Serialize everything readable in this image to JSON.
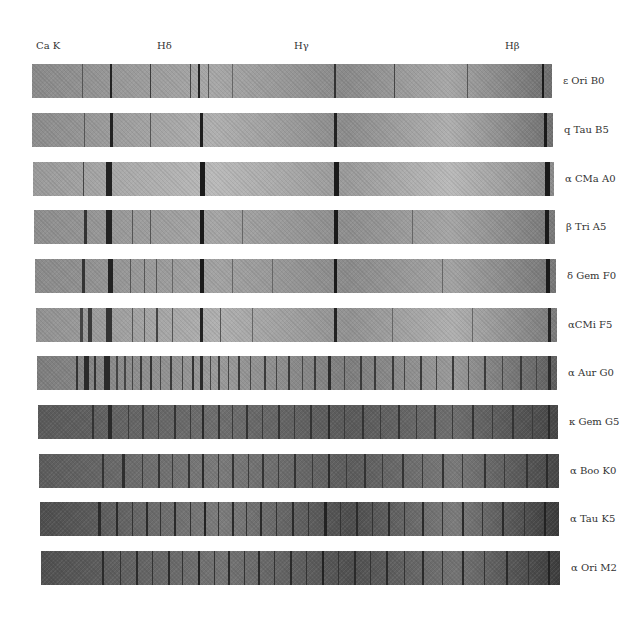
{
  "figure": {
    "line_labels": [
      {
        "text": "Ca K",
        "x": 36
      },
      {
        "text": "Hδ",
        "x": 157
      },
      {
        "text": "Hγ",
        "x": 294
      },
      {
        "text": "Hβ",
        "x": 505
      }
    ],
    "spectra": [
      {
        "label": "ε Ori B0",
        "top": 64,
        "left": 32,
        "right": 552,
        "base": "#8a8a8a",
        "light": "#a8a8a8",
        "dark_end": "#6e6e6e",
        "lines": [
          [
            50,
            1,
            "#555"
          ],
          [
            78,
            2,
            "#222"
          ],
          [
            118,
            1,
            "#3a3a3a"
          ],
          [
            158,
            1,
            "#444"
          ],
          [
            166,
            2,
            "#222"
          ],
          [
            176,
            1,
            "#555"
          ],
          [
            200,
            1,
            "#666"
          ],
          [
            302,
            2,
            "#333"
          ],
          [
            362,
            1,
            "#444"
          ],
          [
            435,
            1,
            "#555"
          ],
          [
            510,
            2,
            "#1a1a1a"
          ],
          [
            530,
            1,
            "#444"
          ]
        ]
      },
      {
        "label": "q Tau B5",
        "top": 113,
        "left": 32,
        "right": 553,
        "base": "#8c8c8c",
        "light": "#b0b0b0",
        "dark_end": "#707070",
        "lines": [
          [
            52,
            1,
            "#555"
          ],
          [
            78,
            3,
            "#222"
          ],
          [
            118,
            1,
            "#555"
          ],
          [
            168,
            3,
            "#1e1e1e"
          ],
          [
            302,
            3,
            "#222"
          ],
          [
            512,
            3,
            "#1a1a1a"
          ],
          [
            535,
            1,
            "#444"
          ]
        ]
      },
      {
        "label": "α CMa A0",
        "top": 162,
        "left": 33,
        "right": 554,
        "base": "#9a9a9a",
        "light": "#bababa",
        "dark_end": "#8a8a8a",
        "lines": [
          [
            51,
            1,
            "#444"
          ],
          [
            74,
            6,
            "#222"
          ],
          [
            168,
            5,
            "#1a1a1a"
          ],
          [
            302,
            5,
            "#1a1a1a"
          ],
          [
            513,
            5,
            "#1a1a1a"
          ]
        ]
      },
      {
        "label": "β Tri A5",
        "top": 210,
        "left": 34,
        "right": 555,
        "base": "#8e8e8e",
        "light": "#a6a6a6",
        "dark_end": "#787878",
        "lines": [
          [
            52,
            3,
            "#333"
          ],
          [
            74,
            6,
            "#222"
          ],
          [
            100,
            1,
            "#555"
          ],
          [
            118,
            1,
            "#555"
          ],
          [
            168,
            4,
            "#1a1a1a"
          ],
          [
            210,
            1,
            "#666"
          ],
          [
            302,
            4,
            "#1a1a1a"
          ],
          [
            380,
            1,
            "#666"
          ],
          [
            513,
            4,
            "#1a1a1a"
          ],
          [
            535,
            1,
            "#555"
          ]
        ]
      },
      {
        "label": "δ Gem F0",
        "top": 259,
        "left": 35,
        "right": 556,
        "base": "#8b8b8b",
        "light": "#a3a3a3",
        "dark_end": "#767676",
        "lines": [
          [
            50,
            3,
            "#333"
          ],
          [
            76,
            5,
            "#222"
          ],
          [
            98,
            1,
            "#555"
          ],
          [
            112,
            1,
            "#555"
          ],
          [
            124,
            1,
            "#555"
          ],
          [
            140,
            1,
            "#666"
          ],
          [
            168,
            4,
            "#1a1a1a"
          ],
          [
            200,
            1,
            "#666"
          ],
          [
            240,
            1,
            "#666"
          ],
          [
            302,
            3,
            "#1a1a1a"
          ],
          [
            410,
            1,
            "#666"
          ],
          [
            514,
            4,
            "#1a1a1a"
          ],
          [
            535,
            1,
            "#444"
          ],
          [
            545,
            1,
            "#555"
          ]
        ]
      },
      {
        "label": "αCMi F5",
        "top": 308,
        "left": 36,
        "right": 557,
        "base": "#929292",
        "light": "#b0b0b0",
        "dark_end": "#7a7a7a",
        "lines": [
          [
            48,
            3,
            "#444"
          ],
          [
            56,
            4,
            "#3a3a3a"
          ],
          [
            74,
            6,
            "#333"
          ],
          [
            100,
            1,
            "#555"
          ],
          [
            112,
            1,
            "#555"
          ],
          [
            124,
            2,
            "#444"
          ],
          [
            140,
            1,
            "#555"
          ],
          [
            168,
            3,
            "#222"
          ],
          [
            188,
            1,
            "#555"
          ],
          [
            220,
            1,
            "#666"
          ],
          [
            302,
            3,
            "#222"
          ],
          [
            360,
            1,
            "#666"
          ],
          [
            440,
            1,
            "#666"
          ],
          [
            516,
            3,
            "#222"
          ]
        ]
      },
      {
        "label": "α Aur G0",
        "top": 356,
        "left": 37,
        "right": 557,
        "base": "#7e7e7e",
        "light": "#9a9a9a",
        "dark_end": "#5e5e5e",
        "lines": [
          [
            44,
            2,
            "#333"
          ],
          [
            52,
            5,
            "#2a2a2a"
          ],
          [
            62,
            2,
            "#333"
          ],
          [
            72,
            6,
            "#2a2a2a"
          ],
          [
            84,
            2,
            "#444"
          ],
          [
            92,
            2,
            "#444"
          ],
          [
            100,
            1,
            "#444"
          ],
          [
            108,
            2,
            "#3a3a3a"
          ],
          [
            118,
            2,
            "#333"
          ],
          [
            128,
            1,
            "#444"
          ],
          [
            138,
            2,
            "#3a3a3a"
          ],
          [
            150,
            1,
            "#444"
          ],
          [
            160,
            2,
            "#333"
          ],
          [
            168,
            3,
            "#2a2a2a"
          ],
          [
            178,
            1,
            "#444"
          ],
          [
            186,
            2,
            "#3a3a3a"
          ],
          [
            196,
            1,
            "#444"
          ],
          [
            206,
            2,
            "#3a3a3a"
          ],
          [
            218,
            1,
            "#444"
          ],
          [
            232,
            2,
            "#3a3a3a"
          ],
          [
            244,
            1,
            "#444"
          ],
          [
            256,
            2,
            "#3a3a3a"
          ],
          [
            270,
            1,
            "#444"
          ],
          [
            282,
            2,
            "#3a3a3a"
          ],
          [
            296,
            3,
            "#2a2a2a"
          ],
          [
            312,
            1,
            "#444"
          ],
          [
            328,
            2,
            "#3a3a3a"
          ],
          [
            342,
            2,
            "#3a3a3a"
          ],
          [
            360,
            2,
            "#3a3a3a"
          ],
          [
            372,
            1,
            "#444"
          ],
          [
            388,
            2,
            "#3a3a3a"
          ],
          [
            404,
            1,
            "#444"
          ],
          [
            420,
            2,
            "#3a3a3a"
          ],
          [
            436,
            1,
            "#444"
          ],
          [
            452,
            2,
            "#3a3a3a"
          ],
          [
            470,
            1,
            "#444"
          ],
          [
            488,
            2,
            "#3a3a3a"
          ],
          [
            504,
            1,
            "#444"
          ],
          [
            516,
            3,
            "#2a2a2a"
          ],
          [
            532,
            1,
            "#444"
          ]
        ]
      },
      {
        "label": "κ Gem G5",
        "top": 405,
        "left": 38,
        "right": 558,
        "base": "#5a5a5a",
        "light": "#6e6e6e",
        "dark_end": "#464646",
        "lines": [
          [
            60,
            2,
            "#333"
          ],
          [
            76,
            4,
            "#2a2a2a"
          ],
          [
            96,
            1,
            "#3a3a3a"
          ],
          [
            110,
            2,
            "#333"
          ],
          [
            126,
            1,
            "#3a3a3a"
          ],
          [
            142,
            2,
            "#333"
          ],
          [
            158,
            1,
            "#3a3a3a"
          ],
          [
            170,
            2,
            "#2a2a2a"
          ],
          [
            186,
            2,
            "#333"
          ],
          [
            200,
            1,
            "#3a3a3a"
          ],
          [
            214,
            2,
            "#333"
          ],
          [
            230,
            1,
            "#3a3a3a"
          ],
          [
            246,
            2,
            "#333"
          ],
          [
            262,
            1,
            "#3a3a3a"
          ],
          [
            278,
            2,
            "#333"
          ],
          [
            296,
            2,
            "#2a2a2a"
          ],
          [
            312,
            1,
            "#3a3a3a"
          ],
          [
            330,
            2,
            "#333"
          ],
          [
            348,
            1,
            "#3a3a3a"
          ],
          [
            366,
            2,
            "#333"
          ],
          [
            384,
            1,
            "#3a3a3a"
          ],
          [
            402,
            2,
            "#333"
          ],
          [
            420,
            1,
            "#3a3a3a"
          ],
          [
            440,
            2,
            "#333"
          ],
          [
            460,
            1,
            "#3a3a3a"
          ],
          [
            480,
            2,
            "#333"
          ],
          [
            500,
            1,
            "#3a3a3a"
          ],
          [
            516,
            2,
            "#2a2a2a"
          ]
        ]
      },
      {
        "label": "α Boo K0",
        "top": 454,
        "left": 39,
        "right": 559,
        "base": "#5c5c5c",
        "light": "#7a7a7a",
        "dark_end": "#464646",
        "lines": [
          [
            70,
            2,
            "#333"
          ],
          [
            90,
            3,
            "#2e2e2e"
          ],
          [
            110,
            1,
            "#3a3a3a"
          ],
          [
            126,
            2,
            "#333"
          ],
          [
            140,
            1,
            "#3a3a3a"
          ],
          [
            156,
            2,
            "#333"
          ],
          [
            170,
            2,
            "#2a2a2a"
          ],
          [
            186,
            1,
            "#3a3a3a"
          ],
          [
            200,
            2,
            "#333"
          ],
          [
            216,
            1,
            "#3a3a3a"
          ],
          [
            230,
            2,
            "#333"
          ],
          [
            246,
            1,
            "#3a3a3a"
          ],
          [
            262,
            2,
            "#333"
          ],
          [
            280,
            1,
            "#3a3a3a"
          ],
          [
            296,
            2,
            "#2a2a2a"
          ],
          [
            314,
            1,
            "#3a3a3a"
          ],
          [
            332,
            2,
            "#333"
          ],
          [
            350,
            1,
            "#3a3a3a"
          ],
          [
            370,
            2,
            "#333"
          ],
          [
            390,
            1,
            "#3a3a3a"
          ],
          [
            410,
            2,
            "#333"
          ],
          [
            430,
            1,
            "#3a3a3a"
          ],
          [
            452,
            2,
            "#333"
          ],
          [
            472,
            1,
            "#3a3a3a"
          ],
          [
            494,
            2,
            "#333"
          ],
          [
            514,
            2,
            "#2a2a2a"
          ]
        ]
      },
      {
        "label": "α Tau K5",
        "top": 502,
        "left": 40,
        "right": 559,
        "base": "#4e4e4e",
        "light": "#7c7c7c",
        "dark_end": "#3a3a3a",
        "lines": [
          [
            66,
            3,
            "#2a2a2a"
          ],
          [
            84,
            2,
            "#2a2a2a"
          ],
          [
            100,
            1,
            "#333"
          ],
          [
            114,
            2,
            "#2a2a2a"
          ],
          [
            128,
            1,
            "#333"
          ],
          [
            142,
            2,
            "#2a2a2a"
          ],
          [
            158,
            1,
            "#333"
          ],
          [
            172,
            2,
            "#222"
          ],
          [
            186,
            1,
            "#333"
          ],
          [
            200,
            2,
            "#2a2a2a"
          ],
          [
            214,
            1,
            "#333"
          ],
          [
            228,
            2,
            "#2a2a2a"
          ],
          [
            244,
            1,
            "#333"
          ],
          [
            260,
            2,
            "#2a2a2a"
          ],
          [
            276,
            1,
            "#333"
          ],
          [
            292,
            3,
            "#222"
          ],
          [
            308,
            1,
            "#333"
          ],
          [
            324,
            2,
            "#2a2a2a"
          ],
          [
            340,
            1,
            "#333"
          ],
          [
            356,
            2,
            "#2a2a2a"
          ],
          [
            372,
            1,
            "#333"
          ],
          [
            390,
            2,
            "#2a2a2a"
          ],
          [
            410,
            1,
            "#333"
          ],
          [
            430,
            2,
            "#2a2a2a"
          ],
          [
            450,
            1,
            "#333"
          ],
          [
            470,
            2,
            "#2a2a2a"
          ],
          [
            492,
            1,
            "#333"
          ],
          [
            512,
            2,
            "#222"
          ]
        ]
      },
      {
        "label": "α Ori M2",
        "top": 551,
        "left": 41,
        "right": 560,
        "base": "#505050",
        "light": "#747474",
        "dark_end": "#3c3c3c",
        "lines": [
          [
            70,
            2,
            "#2a2a2a"
          ],
          [
            88,
            1,
            "#333"
          ],
          [
            104,
            2,
            "#2a2a2a"
          ],
          [
            120,
            1,
            "#333"
          ],
          [
            136,
            2,
            "#2a2a2a"
          ],
          [
            150,
            1,
            "#333"
          ],
          [
            166,
            2,
            "#222"
          ],
          [
            182,
            1,
            "#333"
          ],
          [
            196,
            2,
            "#2a2a2a"
          ],
          [
            212,
            1,
            "#333"
          ],
          [
            226,
            2,
            "#2a2a2a"
          ],
          [
            242,
            1,
            "#333"
          ],
          [
            258,
            2,
            "#2a2a2a"
          ],
          [
            274,
            1,
            "#333"
          ],
          [
            290,
            2,
            "#222"
          ],
          [
            306,
            1,
            "#333"
          ],
          [
            322,
            2,
            "#2a2a2a"
          ],
          [
            338,
            1,
            "#333"
          ],
          [
            354,
            2,
            "#2a2a2a"
          ],
          [
            372,
            1,
            "#333"
          ],
          [
            390,
            2,
            "#2a2a2a"
          ],
          [
            410,
            1,
            "#333"
          ],
          [
            430,
            2,
            "#2a2a2a"
          ],
          [
            452,
            1,
            "#333"
          ],
          [
            474,
            2,
            "#2a2a2a"
          ],
          [
            496,
            1,
            "#333"
          ],
          [
            516,
            2,
            "#222"
          ]
        ]
      }
    ]
  }
}
